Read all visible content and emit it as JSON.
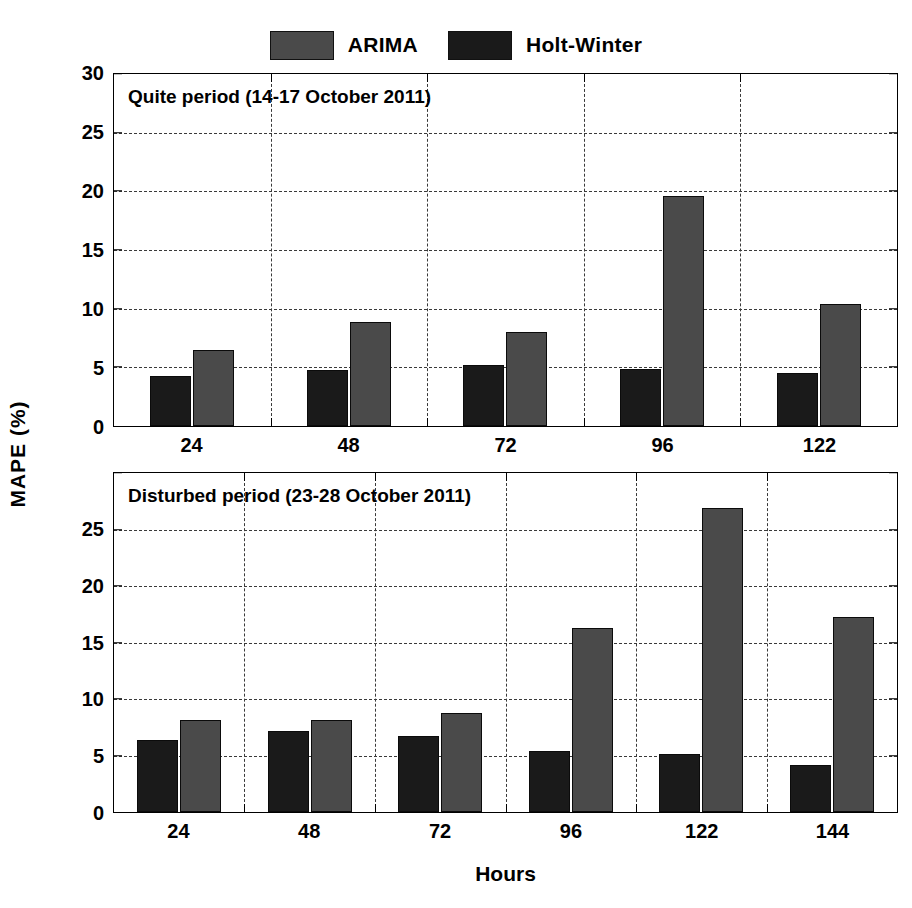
{
  "legend": {
    "entries": [
      {
        "label": "ARIMA",
        "key": "arima",
        "color": "#4a4a4a"
      },
      {
        "label": "Holt-Winter",
        "key": "holt",
        "color": "#1a1a1a"
      }
    ]
  },
  "axis": {
    "ylabel": "MAPE (%)",
    "xlabel": "Hours",
    "yticks": [
      "0",
      "5",
      "10",
      "15",
      "20",
      "25",
      "30"
    ]
  },
  "chart_data": [
    {
      "type": "bar",
      "title": "Quite period (14-17 October 2011)",
      "xlabel": "Hours",
      "ylabel": "MAPE (%)",
      "ylim": [
        0,
        30
      ],
      "ytick_step": 5,
      "grid": true,
      "legend_position": "top-center",
      "categories": [
        "24",
        "48",
        "72",
        "96",
        "122"
      ],
      "series": [
        {
          "name": "Holt-Winter",
          "values": [
            4.3,
            4.8,
            5.2,
            4.9,
            4.5
          ]
        },
        {
          "name": "ARIMA",
          "values": [
            6.5,
            8.9,
            8.0,
            19.6,
            10.4
          ]
        }
      ]
    },
    {
      "type": "bar",
      "title": "Disturbed period (23-28 October 2011)",
      "xlabel": "Hours",
      "ylabel": "MAPE (%)",
      "ylim": [
        0,
        30
      ],
      "ytick_step": 5,
      "grid": true,
      "legend_position": "top-center",
      "categories": [
        "24",
        "48",
        "72",
        "96",
        "122",
        "144"
      ],
      "series": [
        {
          "name": "Holt-Winter",
          "values": [
            6.4,
            7.2,
            6.7,
            5.4,
            5.1,
            4.2
          ]
        },
        {
          "name": "ARIMA",
          "values": [
            8.1,
            8.1,
            8.8,
            16.3,
            26.9,
            17.3
          ]
        }
      ]
    }
  ]
}
